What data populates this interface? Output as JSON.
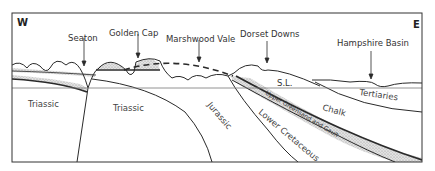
{
  "diagram": {
    "type": "geological cross-section",
    "directions": {
      "west": "W",
      "east": "E"
    },
    "locations": [
      {
        "id": "seaton",
        "label": "Seaton"
      },
      {
        "id": "golden-cap",
        "label": "Golden Cap"
      },
      {
        "id": "marshwood-vale",
        "label": "Marshwood Vale"
      },
      {
        "id": "dorset-downs",
        "label": "Dorset Downs"
      },
      {
        "id": "hampshire-basin",
        "label": "Hampshire Basin"
      }
    ],
    "sea_level_label": "S.L.",
    "strata": [
      {
        "id": "triassic-west",
        "label": "Triassic"
      },
      {
        "id": "triassic-central",
        "label": "Triassic"
      },
      {
        "id": "jurassic",
        "label": "Jurassic"
      },
      {
        "id": "lower-cretaceous",
        "label": "Lower Cretaceous"
      },
      {
        "id": "upper-greensand-gault",
        "label": "Upper Greensand and Gault"
      },
      {
        "id": "chalk",
        "label": "Chalk"
      },
      {
        "id": "tertiaries",
        "label": "Tertiaries"
      }
    ],
    "colors": {
      "line": "#2a2a2a",
      "stipple_fill": "#d4d4d4",
      "frame": "#333333",
      "background": "#ffffff"
    }
  }
}
